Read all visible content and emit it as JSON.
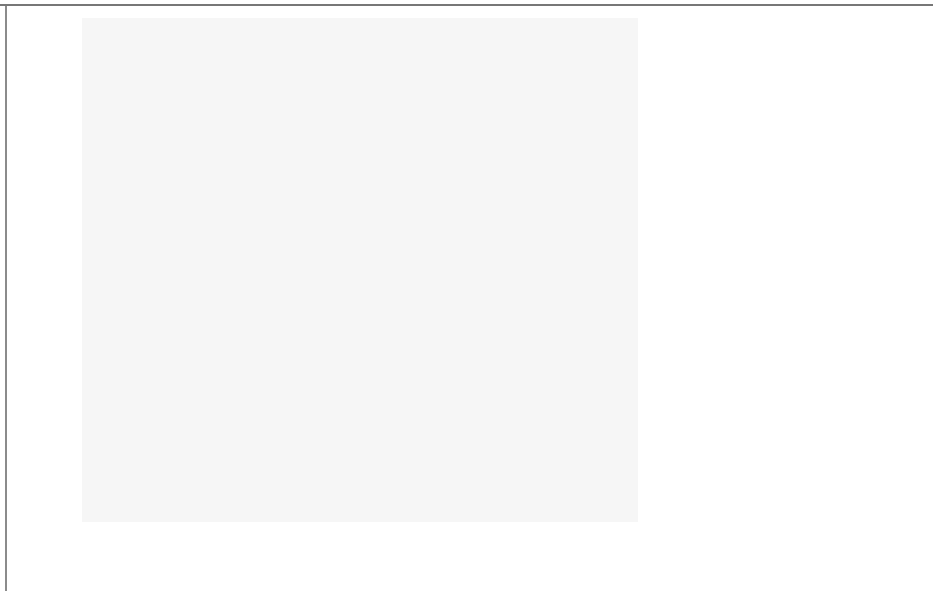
{
  "chart_data": {
    "type": "line",
    "title": "",
    "subtitle": "",
    "xlabel": "x",
    "ylabel": "y1",
    "xlim": [
      0.6,
      10.6
    ],
    "ylim": [
      -0.5,
      32.5
    ],
    "grid": true,
    "x_ticks": [
      "2.5",
      "5.0",
      "7.5",
      "10.0"
    ],
    "x_tick_values": [
      2.5,
      5.0,
      7.5,
      10.0
    ],
    "y_ticks": [
      "0",
      "10",
      "20",
      "30"
    ],
    "y_tick_values": [
      0,
      10,
      20,
      30
    ],
    "legend": {
      "position": "right",
      "title": "Thickness based on y2",
      "entries": [
        {
          "label": "25",
          "value": 25,
          "swatch_height_px": 17
        },
        {
          "label": "50",
          "value": 50,
          "swatch_height_px": 20
        },
        {
          "label": "75",
          "value": 75,
          "swatch_height_px": 23
        },
        {
          "label": "100",
          "value": 100,
          "swatch_height_px": 27
        }
      ]
    },
    "series": [
      {
        "name": "y1",
        "color": "#080808",
        "size_variable": "y2",
        "x": [
          1,
          2,
          3,
          4,
          5,
          6,
          7,
          8,
          9,
          10
        ],
        "y": [
          1.0,
          3.0,
          5.5,
          8.3,
          11.5,
          14.9,
          18.7,
          22.8,
          27.0,
          31.5
        ],
        "thickness": [
          10,
          20,
          30,
          40,
          50,
          60,
          70,
          80,
          90,
          100
        ]
      }
    ]
  }
}
